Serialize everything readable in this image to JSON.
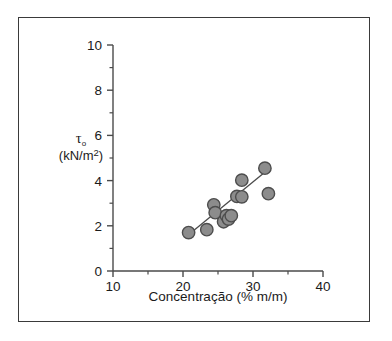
{
  "figure": {
    "background_color": "#ffffff",
    "frame_color": "#3a3a3a",
    "axis_color": "#4a4a4a"
  },
  "chart_data": {
    "type": "scatter",
    "title": "",
    "subtitle": "",
    "xlabel": "Concentração (% m/m)",
    "ylabel_symbol": "τ",
    "ylabel_subscript": "o",
    "ylabel_units": "(kN/m",
    "ylabel_units_sup": "2",
    "ylabel_units_end": ")",
    "xlim": [
      10,
      40
    ],
    "ylim": [
      0,
      10
    ],
    "xticks": [
      10,
      20,
      30,
      40
    ],
    "xticklabels": [
      "10",
      "20",
      "30",
      "40"
    ],
    "xminorticks": [
      15,
      25,
      35
    ],
    "yticks": [
      0,
      2,
      4,
      6,
      8,
      10
    ],
    "yticklabels": [
      "0",
      "2",
      "4",
      "6",
      "8",
      "10"
    ],
    "yminorticks": [
      1,
      3,
      5,
      7,
      9
    ],
    "grid": false,
    "legend": null,
    "marker": {
      "shape": "circle",
      "fill_color": "#8c8c8c",
      "edge_color": "#4d4d4d",
      "radius_px": 6.2
    },
    "points": [
      {
        "x": 20.8,
        "y": 1.7
      },
      {
        "x": 23.4,
        "y": 1.83
      },
      {
        "x": 24.4,
        "y": 2.93
      },
      {
        "x": 24.6,
        "y": 2.58
      },
      {
        "x": 25.8,
        "y": 2.18
      },
      {
        "x": 26.2,
        "y": 2.45
      },
      {
        "x": 26.5,
        "y": 2.3
      },
      {
        "x": 26.9,
        "y": 2.45
      },
      {
        "x": 27.7,
        "y": 3.3
      },
      {
        "x": 28.4,
        "y": 3.28
      },
      {
        "x": 28.4,
        "y": 4.02
      },
      {
        "x": 31.7,
        "y": 4.55
      },
      {
        "x": 32.2,
        "y": 3.42
      }
    ],
    "trendline": {
      "type": "linear-fit",
      "x_start": 20.7,
      "y_start": 1.58,
      "x_end": 31.9,
      "y_end": 4.42,
      "color": "#4a4a4a"
    }
  }
}
